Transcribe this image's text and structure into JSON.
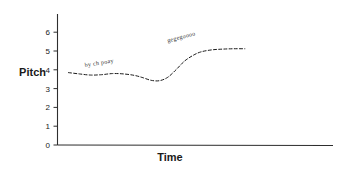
{
  "chart_data": {
    "type": "line",
    "title": "",
    "xlabel": "Time",
    "ylabel": "Pitch",
    "ylim": [
      0,
      6.4
    ],
    "xlim": [
      0,
      100
    ],
    "grid": false,
    "legend": false,
    "line_style": "dashed",
    "y_ticks": [
      "0",
      "1",
      "2",
      "3",
      "4",
      "5",
      "6"
    ],
    "y_tick_values": [
      0,
      1,
      2,
      3,
      4,
      5,
      6
    ],
    "x_ticks": [],
    "series": [
      {
        "name": "pitch contour",
        "x": [
          4,
          8,
          12,
          16,
          20,
          24,
          28,
          31,
          34,
          37,
          40,
          43,
          46,
          49,
          52,
          56,
          60,
          64,
          68
        ],
        "y": [
          3.85,
          3.78,
          3.72,
          3.74,
          3.8,
          3.78,
          3.7,
          3.58,
          3.44,
          3.42,
          3.6,
          4.0,
          4.45,
          4.75,
          4.95,
          5.06,
          5.1,
          5.12,
          5.12
        ]
      }
    ],
    "annotations": [
      {
        "text": "by ch poay",
        "x": 10,
        "y": 4.15,
        "rotation": -9
      },
      {
        "text": "gegegoooo",
        "x": 40,
        "y": 5.45,
        "rotation": -15
      }
    ]
  },
  "axes": {
    "y_label": "Pitch",
    "x_label": "Time"
  }
}
